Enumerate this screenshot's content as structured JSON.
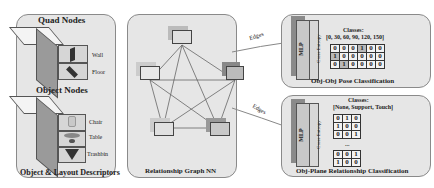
{
  "left_panel": {
    "quad_title": "Quad Nodes",
    "quad_labels": [
      "Wall",
      "Floor"
    ],
    "object_title": "Object Nodes",
    "object_labels": [
      "Chair",
      "Table",
      "Trashbin"
    ],
    "footer": "Object & Layout Descriptors"
  },
  "center_panel": {
    "footer": "Relationship Graph NN",
    "node_count": 5
  },
  "edges": {
    "top_label": "Edges",
    "bottom_label": "Edges"
  },
  "top_right": {
    "mlp_label": "MLP",
    "loss_label": "Cross Entropy",
    "classes_title": "Classes:",
    "classes_values": "[0, 30, 60, 90, 120, 150]",
    "matrix": [
      [
        0,
        0,
        0,
        1,
        0,
        0
      ],
      [
        1,
        0,
        0,
        0,
        0,
        0
      ],
      [
        0,
        1,
        0,
        0,
        0,
        0
      ]
    ],
    "footer": "Obj-Obj Pose Classification"
  },
  "bottom_right": {
    "mlp_label": "MLP",
    "loss_label": "Cross Entropy",
    "classes_title": "Classes:",
    "classes_values": "[None, Support, Touch]",
    "matrix_top": [
      [
        0,
        1,
        0
      ],
      [
        1,
        0,
        0
      ],
      [
        0,
        0,
        1
      ]
    ],
    "ellipsis": "...",
    "matrix_bottom": [
      [
        0,
        0,
        1
      ],
      [
        1,
        0,
        0
      ]
    ],
    "footer": "Obj-Plane Relationship Classification"
  }
}
